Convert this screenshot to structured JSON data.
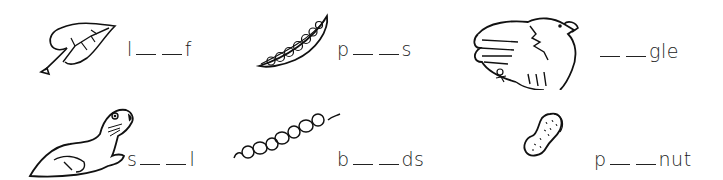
{
  "worksheet": {
    "items": [
      {
        "picture": "leaf",
        "prefix": "l",
        "suffix": "f",
        "blanks": 2
      },
      {
        "picture": "peas",
        "prefix": "p",
        "suffix": "s",
        "blanks": 2
      },
      {
        "picture": "eagle",
        "prefix": "",
        "suffix": "gle",
        "blanks": 2
      },
      {
        "picture": "seal",
        "prefix": "s",
        "suffix": "l",
        "blanks": 2
      },
      {
        "picture": "beads",
        "prefix": "b",
        "suffix": "ds",
        "blanks": 2
      },
      {
        "picture": "peanut",
        "prefix": "p",
        "suffix": "nut",
        "blanks": 2
      }
    ]
  },
  "colors": {
    "ink": "#1a1a1a",
    "background": "#ffffff"
  }
}
